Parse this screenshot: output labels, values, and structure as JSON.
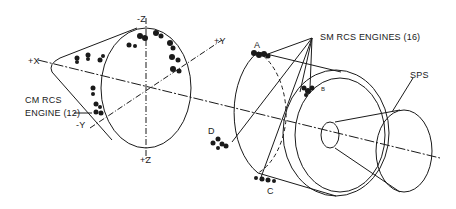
{
  "diagram": {
    "type": "technical-illustration",
    "axes": {
      "plus_x": "+X",
      "minus_z": "-Z",
      "plus_y": "+Y",
      "minus_y": "-Y",
      "plus_z": "+Z"
    },
    "labels": {
      "cm_rcs_line1": "CM RCS",
      "cm_rcs_line2": "ENGINE (12)",
      "sm_rcs": "SM RCS ENGINES (16)",
      "sps": "SPS"
    },
    "quads": {
      "a": "A",
      "b": "B",
      "c": "C",
      "d": "D"
    },
    "colors": {
      "line": "#1a1a1a",
      "background": "#ffffff"
    }
  }
}
